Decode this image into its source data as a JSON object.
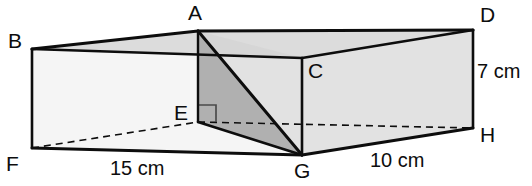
{
  "figure": {
    "shape_type": "cuboid",
    "background_color": "#ffffff",
    "line_color": "#0d0d0d",
    "face_fill_light": "#e8e8e8",
    "face_fill_white": "#f7f7f7",
    "triangle_fill": "#b4b4b4",
    "top_face_fill": "#dcdcdc"
  },
  "vertices": [
    {
      "name": "A",
      "label": "A",
      "x": 198,
      "y": 31,
      "label_x": 188,
      "label_y": 2,
      "hidden": false
    },
    {
      "name": "B",
      "label": "B",
      "x": 32,
      "y": 49,
      "label_x": 8,
      "label_y": 30,
      "hidden": false
    },
    {
      "name": "C",
      "label": "C",
      "x": 302,
      "y": 58,
      "label_x": 308,
      "label_y": 60,
      "hidden": false
    },
    {
      "name": "D",
      "label": "D",
      "x": 473,
      "y": 30,
      "label_x": 480,
      "label_y": 4,
      "hidden": false
    },
    {
      "name": "E",
      "label": "E",
      "x": 198,
      "y": 122,
      "label_x": 174,
      "label_y": 102,
      "hidden": false
    },
    {
      "name": "F",
      "label": "F",
      "x": 32,
      "y": 148,
      "label_x": 6,
      "label_y": 153,
      "hidden": false
    },
    {
      "name": "G",
      "label": "G",
      "x": 302,
      "y": 155,
      "label_x": 294,
      "label_y": 160,
      "hidden": false
    },
    {
      "name": "H",
      "label": "H",
      "x": 473,
      "y": 128,
      "label_x": 480,
      "label_y": 124,
      "hidden": false
    }
  ],
  "dimensions": [
    {
      "name": "width",
      "text": "15 cm",
      "x": 110,
      "y": 158,
      "edge": "F-G"
    },
    {
      "name": "depth",
      "text": "10 cm",
      "x": 370,
      "y": 150,
      "edge": "G-H"
    },
    {
      "name": "height",
      "text": "7 cm",
      "x": 477,
      "y": 61,
      "edge": "D-H"
    }
  ],
  "annotations": [
    {
      "name": "right-angle-marker",
      "at_vertex": "E",
      "symbol": "right-angle",
      "x": 199,
      "y": 105,
      "size": 17
    }
  ],
  "edges": {
    "solid": [
      "B-A",
      "A-D",
      "B-C",
      "C-D",
      "A-C",
      "B-F",
      "D-H",
      "C-G",
      "F-G",
      "G-H",
      "A-G",
      "E-G"
    ],
    "dashed": [
      "F-E",
      "E-H"
    ]
  },
  "shaded_triangle": {
    "name": "triangle-AEG",
    "vertices": [
      "A",
      "E",
      "G"
    ],
    "fill": "#b4b4b4"
  }
}
